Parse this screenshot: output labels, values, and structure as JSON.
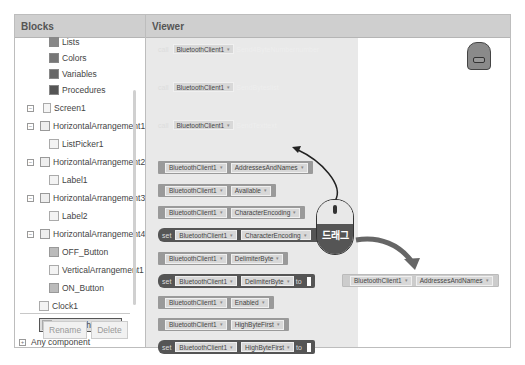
{
  "blocks_panel": {
    "title": "Blocks",
    "tree": [
      {
        "label": "Lists",
        "icon": "lists-icon",
        "level": 2,
        "toggle": null
      },
      {
        "label": "Colors",
        "icon": "colors-icon",
        "level": 2,
        "toggle": null
      },
      {
        "label": "Variables",
        "icon": "variables-icon",
        "level": 2,
        "toggle": null
      },
      {
        "label": "Procedures",
        "icon": "procedures-icon",
        "level": 2,
        "toggle": null
      },
      {
        "label": "Screen1",
        "icon": "screen-icon",
        "level": 0,
        "toggle": "−"
      },
      {
        "label": "HorizontalArrangement1",
        "icon": "horizontal-arrangement-icon",
        "level": 1,
        "toggle": "−"
      },
      {
        "label": "ListPicker1",
        "icon": "listpicker-icon",
        "level": 2,
        "toggle": null
      },
      {
        "label": "HorizontalArrangement2",
        "icon": "horizontal-arrangement-icon",
        "level": 1,
        "toggle": "−"
      },
      {
        "label": "Label1",
        "icon": "label-icon",
        "level": 2,
        "toggle": null
      },
      {
        "label": "HorizontalArrangement3",
        "icon": "horizontal-arrangement-icon",
        "level": 1,
        "toggle": "−"
      },
      {
        "label": "Label2",
        "icon": "label-icon",
        "level": 2,
        "toggle": null
      },
      {
        "label": "HorizontalArrangement4",
        "icon": "horizontal-arrangement-icon",
        "level": 1,
        "toggle": "−"
      },
      {
        "label": "OFF_Button",
        "icon": "button-icon",
        "level": 2,
        "toggle": null
      },
      {
        "label": "VerticalArrangement1",
        "icon": "vertical-arrangement-icon",
        "level": 2,
        "toggle": null
      },
      {
        "label": "ON_Button",
        "icon": "button-icon",
        "level": 2,
        "toggle": null
      },
      {
        "label": "Clock1",
        "icon": "clock-icon",
        "level": 1,
        "toggle": null
      },
      {
        "label": "BluetoothClient1",
        "icon": "bluetooth-icon",
        "level": 1,
        "toggle": null,
        "selected": true
      },
      {
        "label": "Any component",
        "icon": null,
        "level": 0,
        "toggle": "+"
      }
    ],
    "rename_label": "Rename",
    "delete_label": "Delete"
  },
  "viewer": {
    "title": "Viewer",
    "component": "BluetoothClient1",
    "blocks": [
      {
        "type": "call",
        "kw": "call",
        "method": "Send4ByteNumber",
        "arg": "number"
      },
      {
        "type": "call",
        "kw": "call",
        "method": "SendBytes",
        "arg": "list"
      },
      {
        "type": "call",
        "kw": "call",
        "method": "SendText",
        "arg": "text"
      },
      {
        "type": "get",
        "prop": "AddressesAndNames"
      },
      {
        "type": "get",
        "prop": "Available"
      },
      {
        "type": "get",
        "prop": "CharacterEncoding"
      },
      {
        "type": "set",
        "kw": "set",
        "prop": "CharacterEncoding",
        "to": ""
      },
      {
        "type": "get",
        "prop": "DelimiterByte"
      },
      {
        "type": "set",
        "kw": "set",
        "prop": "DelimiterByte",
        "to": "to"
      },
      {
        "type": "get",
        "prop": "Enabled"
      },
      {
        "type": "get",
        "prop": "HighByteFirst"
      },
      {
        "type": "set",
        "kw": "set",
        "prop": "HighByteFirst",
        "to": "to"
      }
    ],
    "dragged_block": {
      "component": "BluetoothClient1",
      "prop": "AddressesAndNames"
    },
    "mouse_label": "드래그",
    "dropdown_arrow": "▾"
  }
}
